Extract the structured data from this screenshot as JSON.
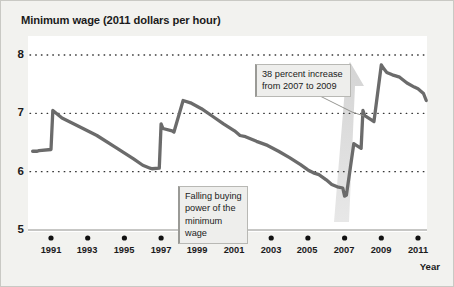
{
  "chart_title": "Minimum wage (2011 dollars per hour)",
  "axis": {
    "x_label": "Year",
    "y_ticks": [
      "8",
      "7",
      "6",
      "5"
    ],
    "x_ticks": [
      "1991",
      "1993",
      "1995",
      "1997",
      "1999",
      "2001",
      "2003",
      "2005",
      "2007",
      "2009",
      "2011"
    ]
  },
  "annotations": {
    "increase": "38 percent increase\nfrom 2007 to 2009",
    "falling": "Falling buying\npower of the\nminimum wage"
  },
  "colors": {
    "line": "#6b6b6b",
    "arrow": "#d8d8d8",
    "grid": "#3a3a3a",
    "plot_background": "#ffffff",
    "page_background": "#f2f2ef",
    "callout_background": "#eeeeec",
    "text": "#1b1b1b"
  },
  "chart_data": {
    "type": "line",
    "title": "Minimum wage (2011 dollars per hour)",
    "xlabel": "Year",
    "ylabel": "Minimum wage (2011 dollars per hour)",
    "xlim": [
      1990,
      2011.6
    ],
    "ylim": [
      5,
      8.1
    ],
    "grid": "horizontal dotted at 6, 7, 8",
    "legend": "none",
    "series": [
      {
        "name": "Real minimum wage (2011 dollars per hour)",
        "x": [
          1990.0,
          1990.25,
          1990.35,
          1991.0,
          1991.1,
          1991.6,
          1992.5,
          1993.5,
          1994.5,
          1995.5,
          1996.0,
          1996.4,
          1996.5,
          1996.9,
          1997.0,
          1997.1,
          1997.6,
          1997.7,
          1998.2,
          1998.6,
          1999.2,
          1999.8,
          2000.4,
          2001.0,
          2001.3,
          2001.6,
          2002.2,
          2002.8,
          2003.4,
          2004.0,
          2004.6,
          2005.0,
          2005.3,
          2005.6,
          2006.0,
          2006.3,
          2006.6,
          2006.9,
          2007.0,
          2007.1,
          2007.5,
          2007.6,
          2007.9,
          2008.0,
          2008.1,
          2008.5,
          2008.6,
          2009.0,
          2009.1,
          2009.3,
          2009.6,
          2010.0,
          2010.4,
          2010.8,
          2011.0,
          2011.3,
          2011.45
        ],
        "y": [
          6.35,
          6.35,
          6.36,
          6.38,
          7.05,
          6.92,
          6.78,
          6.62,
          6.42,
          6.22,
          6.11,
          6.06,
          6.05,
          6.06,
          6.82,
          6.74,
          6.7,
          6.68,
          7.22,
          7.18,
          7.08,
          6.95,
          6.82,
          6.7,
          6.62,
          6.6,
          6.52,
          6.45,
          6.35,
          6.24,
          6.12,
          6.03,
          5.98,
          5.95,
          5.86,
          5.78,
          5.74,
          5.72,
          5.58,
          5.6,
          6.48,
          6.46,
          6.4,
          7.05,
          6.96,
          6.88,
          6.86,
          7.83,
          7.78,
          7.7,
          7.66,
          7.62,
          7.52,
          7.45,
          7.42,
          7.34,
          7.22
        ]
      }
    ],
    "annotations": [
      {
        "text": "38 percent increase from 2007 to 2009",
        "points_to": [
          2008.3,
          7.2
        ]
      },
      {
        "text": "Falling buying power of the minimum wage",
        "region": [
          1999,
          2007
        ]
      }
    ],
    "key_values": {
      "value_1990": 6.35,
      "peak_1991": 7.05,
      "trough_1996": 6.05,
      "peak_1997": 7.22,
      "trough_2007": 5.58,
      "peak_2009": 7.83,
      "value_2011": 7.22,
      "increase_percent": 38
    }
  }
}
